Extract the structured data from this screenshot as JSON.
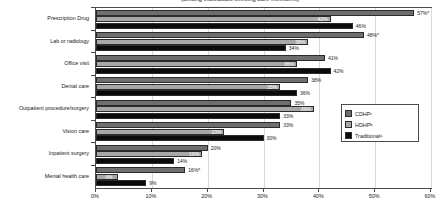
{
  "chart_data": {
    "type": "bar",
    "orientation": "horizontal",
    "title": "(among individuals seeking care members)",
    "categories": [
      "Prescription Drug",
      "Lab or radiology",
      "Office visit",
      "Dental care",
      "Outpatient procedure/surgery",
      "Vision care",
      "Inpatient surgery",
      "Mental health care"
    ],
    "series": [
      {
        "name": "CDHP",
        "superscript": "c",
        "color": "#6e6e6e",
        "values": [
          57,
          48,
          41,
          38,
          35,
          33,
          20,
          16
        ],
        "labels": [
          "57%*",
          "48%*",
          "41%",
          "38%",
          "35%",
          "33%",
          "20%",
          "16%*"
        ]
      },
      {
        "name": "HDHP",
        "superscript": "b",
        "color": "#a8a8a8",
        "values": [
          42,
          38,
          36,
          33,
          39,
          23,
          19,
          4
        ],
        "labels": [
          "42%",
          "38%",
          "36%",
          "33%",
          "39%",
          "23%",
          "19%",
          "4%"
        ]
      },
      {
        "name": "Traditional",
        "superscript": "a",
        "color": "#0b0b0b",
        "values": [
          46,
          34,
          42,
          36,
          33,
          30,
          14,
          9
        ],
        "labels": [
          "46%",
          "34%",
          "42%",
          "36%",
          "33%",
          "30%",
          "14%",
          "9%"
        ]
      }
    ],
    "xlabel": "",
    "ylabel": "",
    "xlim": [
      0,
      60
    ],
    "xticks": [
      0,
      10,
      20,
      30,
      40,
      50,
      60
    ],
    "xtick_labels": [
      "0%",
      "10%",
      "20%",
      "30%",
      "40%",
      "50%",
      "60%"
    ],
    "grid": true,
    "legend_position": "center-right"
  },
  "legend": {
    "entries": [
      {
        "label": "CDHP",
        "sup": "c"
      },
      {
        "label": "HDHP",
        "sup": "b"
      },
      {
        "label": "Traditional",
        "sup": "a"
      }
    ]
  }
}
